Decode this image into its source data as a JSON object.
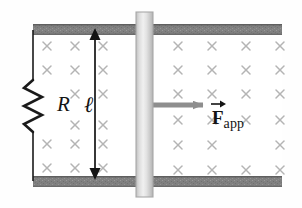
{
  "figure": {
    "background_color": "#fefefe",
    "width": 302,
    "height": 208
  },
  "labels": {
    "resistance": "R",
    "length": "ℓ",
    "force_symbol": "F",
    "force_subscript": "app"
  },
  "colors": {
    "rail": "#808080",
    "rail_edge": "#6e6e6e",
    "wire": "#1a1a1a",
    "field_mark": "#b4b4b4",
    "force_arrow": "#8e8e8e",
    "bar_light": "#e8e8e8",
    "bar_mid": "#d2d2d2",
    "bar_edge": "#a8a8a8",
    "dimension_arrow": "#141414"
  },
  "geometry": {
    "rails": {
      "left_x": 33,
      "right_x": 282,
      "top_y": 25,
      "bottom_y": 176,
      "thickness": 11
    },
    "slider_bar": {
      "x": 136,
      "width": 17,
      "top_y": 12,
      "bottom_y": 197
    },
    "resistor": {
      "x": 33,
      "top_y": 80,
      "bottom_y": 132,
      "peaks": 6,
      "amplitude": 9
    },
    "dimension_arrow": {
      "x": 95,
      "top_y": 30,
      "bottom_y": 178
    },
    "force_arrow": {
      "x_start": 152,
      "x_end": 213,
      "y": 105
    }
  },
  "field": {
    "symbol": "×",
    "direction": "into-page",
    "left_region": {
      "columns_x": [
        47,
        75,
        103
      ],
      "rows_y": [
        46,
        70,
        94,
        125,
        155
      ]
    },
    "right_region": {
      "columns_x": [
        178,
        212,
        246,
        280
      ],
      "rows_y": [
        46,
        70,
        94,
        120,
        145,
        170
      ]
    }
  }
}
